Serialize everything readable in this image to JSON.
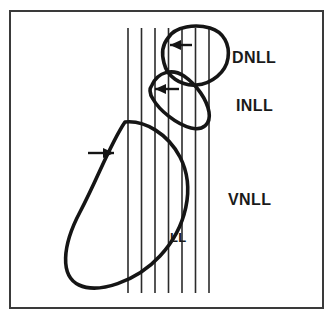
{
  "figure": {
    "background_color": "#ffffff",
    "ink_color": "#151515",
    "frame": {
      "name": "figure-border",
      "x": 10,
      "y": 11,
      "width": 313,
      "height": 297,
      "stroke_color": "#3a3a3a",
      "stroke_width": 2
    },
    "labels": [
      {
        "id": "dnll",
        "text": "DNLL",
        "x": 232,
        "y": 63,
        "size": "major"
      },
      {
        "id": "inll",
        "text": "INLL",
        "x": 236,
        "y": 111,
        "size": "major"
      },
      {
        "id": "vnll",
        "text": "VNLL",
        "x": 228,
        "y": 205,
        "size": "major"
      },
      {
        "id": "ll",
        "text": "LL",
        "x": 170,
        "y": 242,
        "size": "minor"
      }
    ],
    "fibers": {
      "name": "lateral-lemniscus-fiber-tract",
      "count": 7,
      "stroke_color": "#2b2b2b",
      "stroke_width": 1.6,
      "y_top": 28,
      "y_bottom": 293,
      "x_positions": [
        128,
        141.5,
        155,
        168.5,
        182,
        195.5,
        209
      ]
    },
    "loops": [
      {
        "id": "dnll-loop",
        "name": "dnll-projection-loop",
        "stroke_width": 3.6,
        "path": "M 168 38 C 175 26, 196 24, 210 28 C 224 32, 230 45, 228 58 C 226 72, 212 84, 196 85 C 180 86, 167 76, 164 63 C 161 52, 163 44, 168 38 Z",
        "arrow": {
          "x": 170,
          "y": 45,
          "dir": "left",
          "length": 22
        }
      },
      {
        "id": "inll-loop",
        "name": "inll-projection-loop",
        "stroke_width": 3.6,
        "path": "M 152 85 C 158 72, 172 68, 184 76 C 197 85, 207 100, 209 112 C 211 124, 203 131, 191 128 C 176 124, 159 110, 153 99 C 149 93, 149 89, 152 85 Z",
        "arrow": {
          "x": 155,
          "y": 89,
          "dir": "left",
          "length": 24
        }
      },
      {
        "id": "ll-loop",
        "name": "lateral-lemniscus-main-loop",
        "stroke_width": 3.6,
        "path": "M 125 122 C 145 120, 168 134, 180 157 C 196 188, 186 228, 160 256 C 136 282, 98 294, 79 285 C 60 276, 62 246, 80 212 C 98 178, 110 144, 125 122 Z",
        "arrow": {
          "x": 114,
          "y": 153,
          "dir": "right",
          "length": 26
        }
      }
    ]
  }
}
